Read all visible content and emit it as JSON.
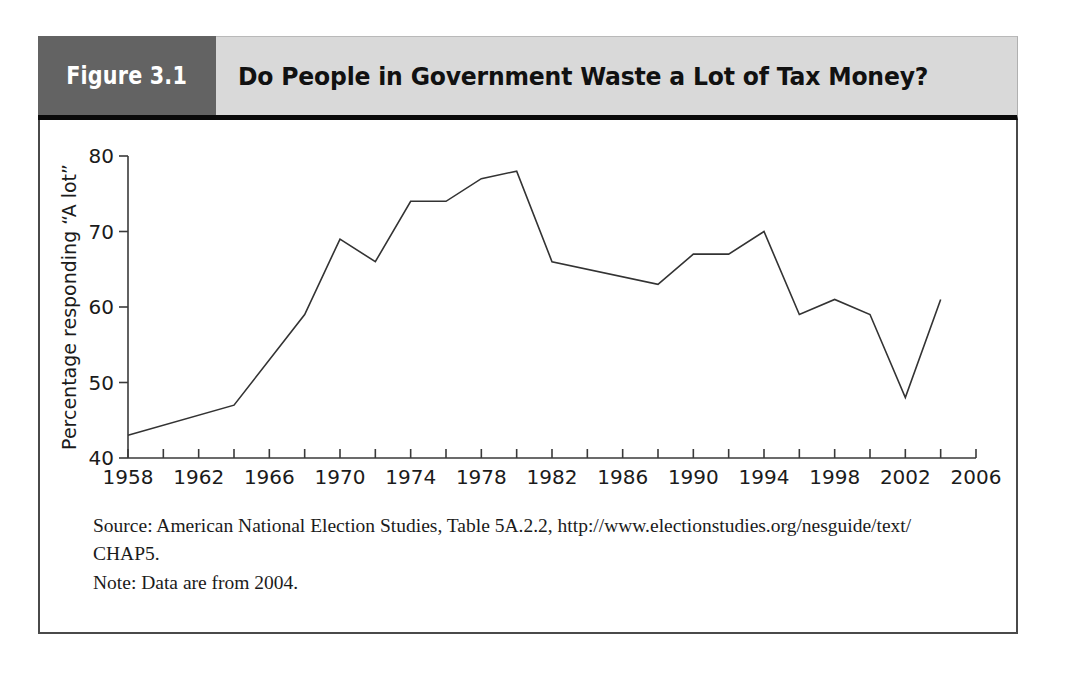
{
  "figure": {
    "label": "Figure 3.1",
    "title": "Do People in Government Waste a Lot of Tax Money?",
    "label_bg": "#636363",
    "title_bg": "#d9d9d9",
    "rule_color": "#0a0a0a",
    "frame_color": "#4a4a4a"
  },
  "notes": {
    "source": "Source: American National Election Studies, Table 5A.2.2, http://www.electionstudies.org/nesguide/text/",
    "source_continuation": "CHAP5.",
    "note": "Note: Data are from 2004."
  },
  "chart_data": {
    "type": "line",
    "title": "Do People in Government Waste a Lot of Tax Money?",
    "xlabel": "",
    "ylabel": "Percentage responding “A lot”",
    "xlim": [
      1958,
      2006
    ],
    "ylim": [
      40,
      80
    ],
    "yticks": [
      40,
      50,
      60,
      70,
      80
    ],
    "ytick_labels": [
      "40",
      "50",
      "60",
      "70",
      "80"
    ],
    "xticks": [
      1958,
      1960,
      1962,
      1964,
      1966,
      1968,
      1970,
      1972,
      1974,
      1976,
      1978,
      1980,
      1982,
      1984,
      1986,
      1988,
      1990,
      1992,
      1994,
      1996,
      1998,
      2000,
      2002,
      2004,
      2006
    ],
    "xtick_labels_shown": [
      "1958",
      "1962",
      "1966",
      "1970",
      "1974",
      "1978",
      "1982",
      "1986",
      "1990",
      "1994",
      "1998",
      "2002",
      "2006"
    ],
    "xtick_label_interval": 4,
    "grid": false,
    "legend": "none",
    "line_color": "#333333",
    "line_width": 1.6,
    "x": [
      1958,
      1964,
      1968,
      1970,
      1972,
      1974,
      1976,
      1978,
      1980,
      1982,
      1988,
      1990,
      1992,
      1994,
      1996,
      1998,
      2000,
      2002,
      2004
    ],
    "values": [
      43,
      47,
      59,
      69,
      66,
      74,
      74,
      77,
      78,
      66,
      63,
      67,
      67,
      70,
      59,
      61,
      59,
      48,
      61
    ],
    "points": [
      {
        "year": 1958,
        "value": 43
      },
      {
        "year": 1964,
        "value": 47
      },
      {
        "year": 1968,
        "value": 59
      },
      {
        "year": 1970,
        "value": 69
      },
      {
        "year": 1972,
        "value": 66
      },
      {
        "year": 1974,
        "value": 74
      },
      {
        "year": 1976,
        "value": 74
      },
      {
        "year": 1978,
        "value": 77
      },
      {
        "year": 1980,
        "value": 78
      },
      {
        "year": 1982,
        "value": 66
      },
      {
        "year": 1988,
        "value": 63
      },
      {
        "year": 1990,
        "value": 67
      },
      {
        "year": 1992,
        "value": 67
      },
      {
        "year": 1994,
        "value": 70
      },
      {
        "year": 1996,
        "value": 59
      },
      {
        "year": 1998,
        "value": 61
      },
      {
        "year": 2000,
        "value": 59
      },
      {
        "year": 2002,
        "value": 48
      },
      {
        "year": 2004,
        "value": 61
      }
    ]
  }
}
